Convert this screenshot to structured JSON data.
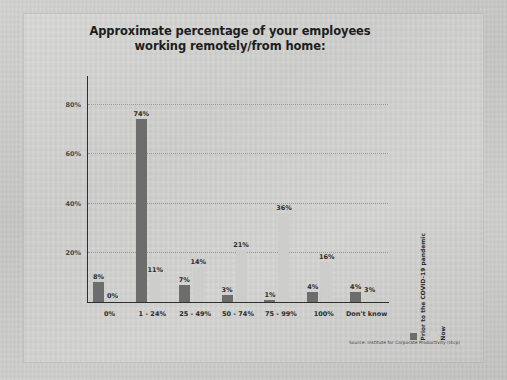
{
  "chart_data": {
    "type": "bar",
    "title": "Approximate percentage of your employees working remotely/from home:",
    "title_line1": "Approximate percentage of your employees",
    "title_line2": "working remotely/from home:",
    "categories": [
      "0%",
      "1 - 24%",
      "25 - 49%",
      "50 - 74%",
      "75 - 99%",
      "100%",
      "Don't know"
    ],
    "series": [
      {
        "name": "Prior to the COVID-19 pandemic",
        "color": "#6d6d6d",
        "values": [
          8,
          74,
          7,
          3,
          1,
          4,
          4
        ],
        "labels": [
          "8%",
          "74%",
          "7%",
          "3%",
          "1%",
          "4%",
          "4%"
        ]
      },
      {
        "name": "Now",
        "color": "#cdcdcb",
        "values": [
          0,
          11,
          14,
          21,
          36,
          16,
          3
        ],
        "labels": [
          "0%",
          "11%",
          "14%",
          "21%",
          "36%",
          "16%",
          "3%"
        ]
      }
    ],
    "xlabel": "",
    "ylabel": "",
    "ylim": [
      0,
      88
    ],
    "yticks": [
      20,
      40,
      60,
      80
    ],
    "ytick_labels": [
      "20%",
      "40%",
      "60%",
      "80%"
    ],
    "grid": true,
    "legend_position": "right-vertical",
    "source": "Source: Institute for Corporate Productivity (i4cp)"
  }
}
